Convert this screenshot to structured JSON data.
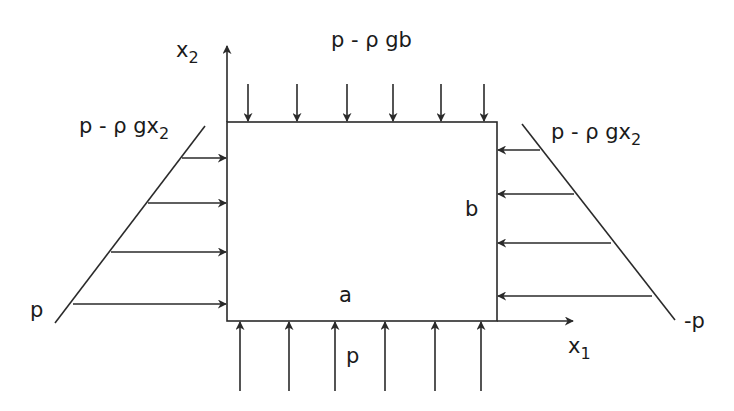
{
  "diagram": {
    "type": "hydrostatic-pressure-loaded rectangular block",
    "colors": {
      "stroke": "#2a2a2a",
      "text": "#1a1a1a",
      "background": "#ffffff"
    },
    "axes": {
      "x1": {
        "label": "x",
        "subscript": "1"
      },
      "x2": {
        "label": "x",
        "subscript": "2"
      }
    },
    "block": {
      "width_label": "a",
      "height_label": "b"
    },
    "loads": {
      "top": {
        "label": "p - ρ gb",
        "arrow_count": 6,
        "direction": "down"
      },
      "bottom": {
        "label": "p",
        "arrow_count": 6,
        "direction": "up"
      },
      "left": {
        "top_label_main": "p - ρ gx",
        "top_label_sub": "2",
        "bottom_label": "p",
        "arrow_count": 4,
        "direction": "right"
      },
      "right": {
        "top_label_main": "p - ρ gx",
        "top_label_sub": "2",
        "bottom_label": "-p",
        "arrow_count": 4,
        "direction": "left"
      }
    }
  }
}
